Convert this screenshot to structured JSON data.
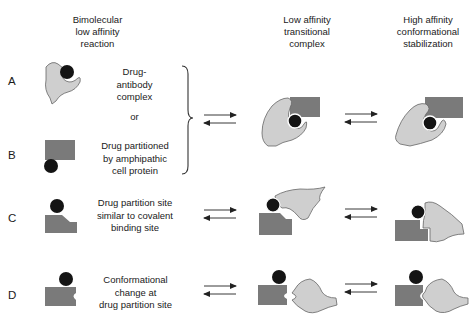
{
  "column_headers": {
    "bimolecular": "Bimolecular\nlow affinity\nreaction",
    "transitional": "Low affinity\ntransitional\ncomplex",
    "stabilization": "High affinity\nconformational\nstabilization"
  },
  "rows": [
    {
      "id": "A",
      "label": "A",
      "description": "Drug-\nantibody\ncomplex"
    },
    {
      "id": "B",
      "label": "B",
      "description": "Drug partitioned\nby amphipathic\ncell protein"
    },
    {
      "id": "C",
      "label": "C",
      "description": "Drug partition site\nsimilar to covalent\nbinding site"
    },
    {
      "id": "D",
      "label": "D",
      "description": "Conformational\nchange at\ndrug partition site"
    }
  ],
  "connector": "or",
  "colors": {
    "antibody_fill": "#cfcfcf",
    "protein_fill": "#7a7a7a",
    "drug_fill": "#141414",
    "outline": "#555555"
  }
}
